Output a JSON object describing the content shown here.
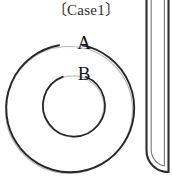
{
  "figure": {
    "title": "〔Case1〕",
    "background_color": "#ffffff",
    "stroke_color": "#2a2a2a",
    "labels": {
      "outer_circle": "A",
      "inner_circle": "B"
    },
    "shapes": {
      "outer_circle": {
        "name": "outer-ring",
        "cx": 70,
        "cy": 108,
        "r": 64,
        "label": "A"
      },
      "inner_circle": {
        "name": "inner-ring",
        "cx": 74,
        "cy": 105,
        "r": 31,
        "label": "B"
      },
      "u_tube": {
        "name": "u-shaped-tube",
        "outer_left_x": 146,
        "outer_right_x": 168,
        "inner_left_x": 150,
        "inner_right_x": 164,
        "top_y": 0,
        "bottom_y": 178
      }
    }
  }
}
